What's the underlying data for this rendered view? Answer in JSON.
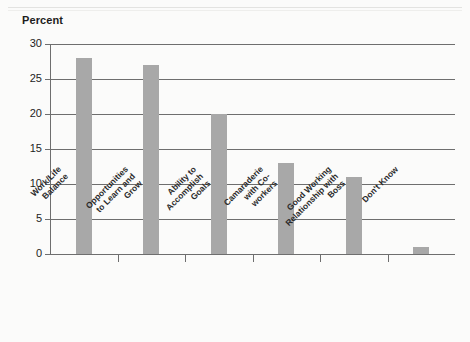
{
  "chart_data": {
    "type": "bar",
    "title": "",
    "subtitle": "",
    "xlabel": "",
    "ylabel": "Percent",
    "ylim": [
      0,
      30
    ],
    "yticks": [
      0,
      5,
      10,
      15,
      20,
      25,
      30
    ],
    "grid": true,
    "legend": false,
    "legend_position": "none",
    "orientation": "vertical",
    "bar_color": "#a8a8a8",
    "categories": [
      "Work/Life Balance",
      "Opportunities to Learn and Grow",
      "Ability to Accomplish Goals",
      "Camaraderie with Co-workers",
      "Good Working Relationship with Boss",
      "Don't Know"
    ],
    "category_lines": [
      [
        "Work/Life",
        "Balance"
      ],
      [
        "Opportunities",
        "to Learn and",
        "Grow"
      ],
      [
        "Ability to",
        "Accomplish",
        "Goals"
      ],
      [
        "Camaraderie",
        "with Co-",
        "workers"
      ],
      [
        "Good Working",
        "Relationship with",
        "Boss"
      ],
      [
        "Don't Know"
      ]
    ],
    "values": [
      28,
      27,
      20,
      13,
      11,
      1
    ]
  },
  "axis": {
    "y_title": "Percent",
    "y_tick_labels": [
      "30",
      "25",
      "20",
      "15",
      "10",
      "5",
      "0"
    ]
  }
}
